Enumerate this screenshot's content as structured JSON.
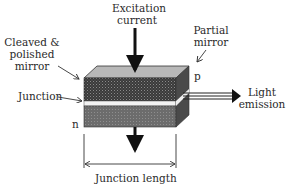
{
  "diagram": {
    "labels": {
      "excitation_line1": "Excitation",
      "excitation_line2": "current",
      "cleaved_line1": "Cleaved &",
      "cleaved_line2": "polished",
      "cleaved_line3": "mirror",
      "partial_line1": "Partial",
      "partial_line2": "mirror",
      "p_region": "p",
      "n_region": "n",
      "junction": "Junction",
      "light_line1": "Light",
      "light_line2": "emission",
      "junction_length": "Junction length"
    },
    "colors": {
      "top_face": "#b8b8b8",
      "p_layer": "#3c3c3c",
      "junction_layer": "#f2f2f2",
      "n_layer": "#6e6e6e",
      "side_face": "#505050",
      "arrow": "#111111"
    }
  }
}
